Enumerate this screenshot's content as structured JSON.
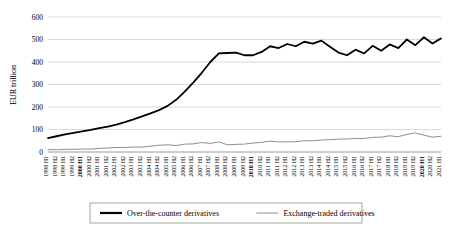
{
  "chart_data": {
    "type": "line",
    "title": "",
    "xlabel": "",
    "ylabel": "EUR trillion",
    "ylim": [
      0,
      600
    ],
    "yticks": [
      0,
      100,
      200,
      300,
      400,
      500,
      600
    ],
    "grid": true,
    "legend_position": "bottom",
    "categories": [
      "1998 H1",
      "1998 H2",
      "1999 H1",
      "1999 H2",
      "2000 H1",
      "2000 H2",
      "2001 H1",
      "2001 H2",
      "2002 H1",
      "2002 H2",
      "2003 H1",
      "2003 H2",
      "2004 H1",
      "2004 H2",
      "2005 H1",
      "2005 H2",
      "2006 H1",
      "2006 H2",
      "2007 H1",
      "2007 H2",
      "2008 H1",
      "2008 H2",
      "2009 H1",
      "2009 H2",
      "2010 H1",
      "2010 H2",
      "2011 H1",
      "2011 H2",
      "2012 H1",
      "2012 H2",
      "2013 H1",
      "2013 H2",
      "2014 H1",
      "2014 H2",
      "2015 H1",
      "2015 H2",
      "2016 H1",
      "2016 H2",
      "2017 H1",
      "2017 H2",
      "2018 H1",
      "2018 H2",
      "2019 H1",
      "2019 H2",
      "2020 H1",
      "2020 H2",
      "2021 H1"
    ],
    "bold_categories": [
      "2000 H1",
      "2010 H1",
      "2020 H1"
    ],
    "series": [
      {
        "name": "Over-the-counter derivatives",
        "color": "#000000",
        "width": 1.8,
        "values": [
          62,
          70,
          78,
          85,
          92,
          98,
          106,
          113,
          122,
          133,
          145,
          158,
          172,
          186,
          205,
          232,
          268,
          308,
          352,
          400,
          438,
          440,
          442,
          430,
          430,
          445,
          470,
          462,
          480,
          470,
          490,
          482,
          495,
          468,
          442,
          430,
          455,
          438,
          472,
          450,
          478,
          462,
          500,
          475,
          510,
          482,
          505
        ]
      },
      {
        "name": "Exchange-traded derivatives",
        "color": "#808080",
        "width": 0.9,
        "values": [
          11,
          10,
          12,
          12,
          13,
          13,
          16,
          18,
          20,
          20,
          22,
          22,
          26,
          30,
          32,
          29,
          35,
          36,
          42,
          38,
          45,
          32,
          34,
          35,
          40,
          43,
          48,
          45,
          45,
          46,
          50,
          50,
          53,
          55,
          57,
          58,
          60,
          60,
          65,
          66,
          72,
          68,
          78,
          85,
          75,
          66,
          70
        ]
      }
    ],
    "legend": [
      {
        "label": "Over-the-counter derivatives",
        "color": "#000000",
        "width": 2.2
      },
      {
        "label": "Exchange-traded derivatives",
        "color": "#8c8c8c",
        "width": 1.0
      }
    ]
  }
}
